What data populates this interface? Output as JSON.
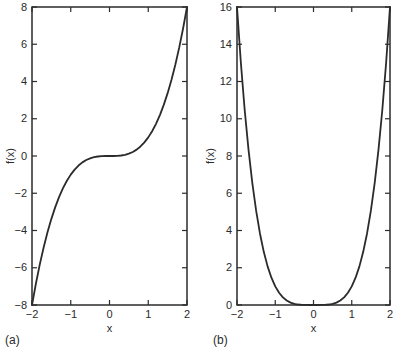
{
  "figure": {
    "background": "#ffffff",
    "line_color": "#2b2b2b",
    "text_color": "#2b2b2b"
  },
  "chart_data": [
    {
      "type": "line",
      "panel_label": "(a)",
      "title": "",
      "xlabel": "x",
      "ylabel": "f(x)",
      "xlim": [
        -2,
        2
      ],
      "ylim": [
        -8,
        8
      ],
      "xticks": [
        -2,
        -1,
        0,
        1,
        2
      ],
      "yticks": [
        -8,
        -6,
        -4,
        -2,
        0,
        2,
        4,
        6,
        8
      ],
      "grid": false,
      "legend": "none",
      "line_color": "#2b2b2b",
      "x": [
        -2,
        -1.9,
        -1.8,
        -1.7,
        -1.6,
        -1.5,
        -1.4,
        -1.3,
        -1.2,
        -1.1,
        -1,
        -0.9,
        -0.8,
        -0.7,
        -0.6,
        -0.5,
        -0.4,
        -0.3,
        -0.2,
        -0.1,
        0,
        0.1,
        0.2,
        0.3,
        0.4,
        0.5,
        0.6,
        0.7,
        0.8,
        0.9,
        1,
        1.1,
        1.2,
        1.3,
        1.4,
        1.5,
        1.6,
        1.7,
        1.8,
        1.9,
        2
      ],
      "y": [
        -8,
        -6.859,
        -5.832,
        -4.913,
        -4.096,
        -3.375,
        -2.744,
        -2.197,
        -1.728,
        -1.331,
        -1,
        -0.729,
        -0.512,
        -0.343,
        -0.216,
        -0.125,
        -0.064,
        -0.027,
        -0.008,
        -0.001,
        0,
        0.001,
        0.008,
        0.027,
        0.064,
        0.125,
        0.216,
        0.343,
        0.512,
        0.729,
        1,
        1.331,
        1.728,
        2.197,
        2.744,
        3.375,
        4.096,
        4.913,
        5.832,
        6.859,
        8
      ]
    },
    {
      "type": "line",
      "panel_label": "(b)",
      "title": "",
      "xlabel": "x",
      "ylabel": "f(x)",
      "xlim": [
        -2,
        2
      ],
      "ylim": [
        0,
        16
      ],
      "xticks": [
        -2,
        -1,
        0,
        1,
        2
      ],
      "yticks": [
        0,
        2,
        4,
        6,
        8,
        10,
        12,
        14,
        16
      ],
      "grid": false,
      "legend": "none",
      "line_color": "#2b2b2b",
      "x": [
        -2,
        -1.9,
        -1.8,
        -1.7,
        -1.6,
        -1.5,
        -1.4,
        -1.3,
        -1.2,
        -1.1,
        -1,
        -0.9,
        -0.8,
        -0.7,
        -0.6,
        -0.5,
        -0.4,
        -0.3,
        -0.2,
        -0.1,
        0,
        0.1,
        0.2,
        0.3,
        0.4,
        0.5,
        0.6,
        0.7,
        0.8,
        0.9,
        1,
        1.1,
        1.2,
        1.3,
        1.4,
        1.5,
        1.6,
        1.7,
        1.8,
        1.9,
        2
      ],
      "y": [
        16,
        13.0321,
        10.4976,
        8.3521,
        6.5536,
        5.0625,
        3.8416,
        2.8561,
        2.0736,
        1.4641,
        1,
        0.6561,
        0.4096,
        0.2401,
        0.1296,
        0.0625,
        0.0256,
        0.0081,
        0.0016,
        0.0001,
        0,
        0.0001,
        0.0016,
        0.0081,
        0.0256,
        0.0625,
        0.1296,
        0.2401,
        0.4096,
        0.6561,
        1,
        1.4641,
        2.0736,
        2.8561,
        3.8416,
        5.0625,
        6.5536,
        8.3521,
        10.4976,
        13.0321,
        16
      ]
    }
  ]
}
